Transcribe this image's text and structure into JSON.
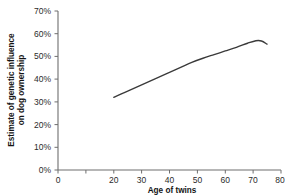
{
  "chart_data": {
    "type": "line",
    "title": "",
    "xlabel": "Age of twins",
    "ylabel": "Estimate of genetic influence on dog ownership",
    "ylabel_line1": "Estimate of genetic influence",
    "ylabel_line2": "on dog ownership",
    "xlim": [
      0,
      80
    ],
    "ylim": [
      0,
      70
    ],
    "xticks": [
      0,
      10,
      20,
      30,
      40,
      50,
      60,
      70,
      80
    ],
    "xtick_labels": [
      "0",
      "",
      "20",
      "30",
      "40",
      "50",
      "60",
      "70",
      "80"
    ],
    "yticks": [
      0,
      10,
      20,
      30,
      40,
      50,
      60,
      70
    ],
    "ytick_labels": [
      "0%",
      "10%",
      "20%",
      "30%",
      "40%",
      "50%",
      "60%",
      "70%"
    ],
    "grid": false,
    "legend": "none",
    "series": [
      {
        "name": "Estimate of genetic influence on dog ownership",
        "color": "#3a3a3a",
        "x": [
          20,
          24,
          28,
          32,
          36,
          40,
          44,
          48,
          52,
          56,
          60,
          64,
          68,
          71,
          73,
          75
        ],
        "values": [
          32.0,
          34.2,
          36.4,
          38.6,
          40.8,
          43.0,
          45.2,
          47.4,
          49.2,
          50.8,
          52.4,
          54.0,
          55.8,
          56.9,
          56.8,
          55.4
        ]
      }
    ]
  },
  "axis": {
    "x_title": "Age of twins",
    "y_title_line1": "Estimate of genetic influence",
    "y_title_line2": "on dog ownership",
    "x_tick_0": "0",
    "x_tick_10": "",
    "x_tick_20": "20",
    "x_tick_30": "30",
    "x_tick_40": "40",
    "x_tick_50": "50",
    "x_tick_60": "60",
    "x_tick_70": "70",
    "x_tick_80": "80",
    "y_tick_0": "0%",
    "y_tick_10": "10%",
    "y_tick_20": "20%",
    "y_tick_30": "30%",
    "y_tick_40": "40%",
    "y_tick_50": "50%",
    "y_tick_60": "60%",
    "y_tick_70": "70%"
  },
  "colors": {
    "line": "#3a3a3a",
    "axis": "#6e6e6e",
    "text": "#2b2b2b",
    "background": "#ffffff"
  }
}
